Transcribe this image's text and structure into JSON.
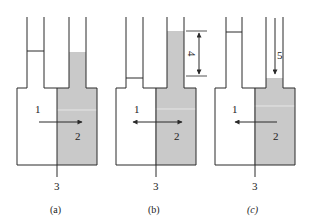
{
  "colors": {
    "line": "#2a2a2a",
    "fill": "#c9c9c9",
    "interface": "#e6e6e6",
    "background": "#ffffff"
  },
  "panels": [
    {
      "id": "a",
      "caption": "(a)",
      "labels": {
        "region_left": "1",
        "region_right": "2",
        "membrane": "3"
      },
      "arrow_direction": "right"
    },
    {
      "id": "b",
      "caption": "(b)",
      "labels": {
        "region_left": "1",
        "region_right": "2",
        "membrane": "3",
        "height_difference": "4"
      },
      "arrow_direction": "both"
    },
    {
      "id": "c",
      "caption": "(c)",
      "labels": {
        "region_left": "1",
        "region_right": "2",
        "membrane": "3",
        "applied_pressure": "5"
      },
      "arrow_direction": "left"
    }
  ]
}
